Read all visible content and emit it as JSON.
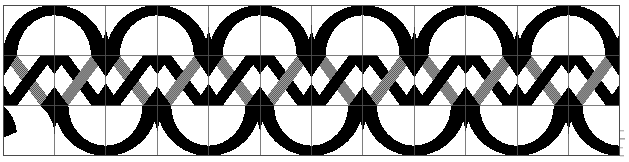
{
  "figure": {
    "kind": "geometric-ornament",
    "background_color": "#ffffff",
    "ink_color": "#000000",
    "hatch_color": "#000000",
    "grid_line_color": "#555555",
    "frame": {
      "x": 3,
      "y": 5,
      "width": 617,
      "height": 151,
      "stroke_width": 1.1,
      "stroke_color": "#4a4a4a"
    },
    "grid": {
      "columns": 12,
      "rows": 3,
      "cell_width": 51.42,
      "cell_height": 50.33,
      "visible": true,
      "line_width": 0.9
    },
    "bands": [
      {
        "name": "top-band",
        "row": 0,
        "motif": "black-crescent-arches",
        "fill": "solid-black",
        "arch_count": 6
      },
      {
        "name": "middle-band",
        "row": 1,
        "motif": "interlaced-chevron-x",
        "fill": "solid-black-and-halftone-hatch",
        "unit_count": 12
      },
      {
        "name": "bottom-band",
        "row": 2,
        "motif": "black-crescent-arches-inverted",
        "fill": "solid-black",
        "arch_count": 6
      }
    ],
    "hatch": {
      "pattern": "fine-checker-halftone",
      "tile_size": 2,
      "dot_color": "#000000",
      "gap_color": "#ffffff"
    },
    "margin_marks": {
      "present": true,
      "description": "faint scan artifacts at right page edge",
      "count": 4
    }
  }
}
